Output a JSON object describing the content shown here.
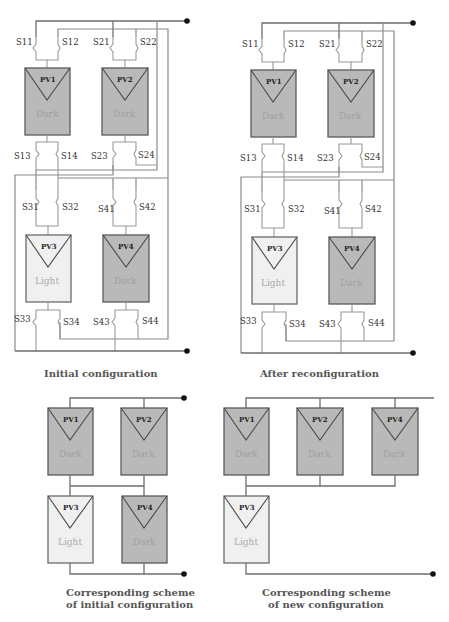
{
  "diagram": {
    "colors": {
      "dark_panel": "#b9b9b9",
      "light_panel": "#f0f0f0",
      "wire": "#8a8a8a",
      "terminal": "#111111"
    },
    "initial": {
      "caption": "Initial  configuration",
      "panels": [
        {
          "id": "PV1",
          "label": "PV1",
          "state": "Dark"
        },
        {
          "id": "PV2",
          "label": "PV2",
          "state": "Dark"
        },
        {
          "id": "PV3",
          "label": "PV3",
          "state": "Light"
        },
        {
          "id": "PV4",
          "label": "PV4",
          "state": "Dark"
        }
      ],
      "switches": [
        "S11",
        "S12",
        "S21",
        "S22",
        "S13",
        "S14",
        "S23",
        "S24",
        "S31",
        "S32",
        "S41",
        "S42",
        "S33",
        "S34",
        "S43",
        "S44"
      ]
    },
    "reconfigured": {
      "caption": "After reconfiguration",
      "panels": [
        {
          "id": "PV1",
          "label": "PV1",
          "state": "Dark"
        },
        {
          "id": "PV2",
          "label": "PV2",
          "state": "Dark"
        },
        {
          "id": "PV3",
          "label": "PV3",
          "state": "Light"
        },
        {
          "id": "PV4",
          "label": "PV4",
          "state": "Dark"
        }
      ],
      "switches": [
        "S11",
        "S12",
        "S21",
        "S22",
        "S13",
        "S14",
        "S23",
        "S24",
        "S31",
        "S32",
        "S41",
        "S42",
        "S33",
        "S34",
        "S43",
        "S44"
      ]
    },
    "scheme_initial": {
      "caption_line1": "Corresponding scheme",
      "caption_line2": "of initial  configuration",
      "panels": [
        {
          "id": "PV1",
          "label": "PV1",
          "state": "Dark"
        },
        {
          "id": "PV2",
          "label": "PV2",
          "state": "Dark"
        },
        {
          "id": "PV3",
          "label": "PV3",
          "state": "Light"
        },
        {
          "id": "PV4",
          "label": "PV4",
          "state": "Dark"
        }
      ]
    },
    "scheme_new": {
      "caption_line1": "Corresponding scheme",
      "caption_line2": "of new configuration",
      "panels": [
        {
          "id": "PV1",
          "label": "PV1",
          "state": "Dark"
        },
        {
          "id": "PV2",
          "label": "PV2",
          "state": "Dark"
        },
        {
          "id": "PV4",
          "label": "PV4",
          "state": "Dark"
        },
        {
          "id": "PV3",
          "label": "PV3",
          "state": "Light"
        }
      ]
    }
  }
}
